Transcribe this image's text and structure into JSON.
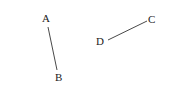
{
  "diagram": {
    "points": [
      {
        "name": "A",
        "label": "A",
        "x": 47,
        "y": 22
      },
      {
        "name": "B",
        "label": "B",
        "x": 59,
        "y": 80
      },
      {
        "name": "C",
        "label": "C",
        "x": 152,
        "y": 22
      },
      {
        "name": "D",
        "label": "D",
        "x": 101,
        "y": 44
      }
    ],
    "segments": [
      {
        "from": "A",
        "to": "B",
        "x1": 48,
        "y1": 27,
        "x2": 57,
        "y2": 70
      },
      {
        "from": "D",
        "to": "C",
        "x1": 108,
        "y1": 40,
        "x2": 147,
        "y2": 21
      }
    ]
  }
}
